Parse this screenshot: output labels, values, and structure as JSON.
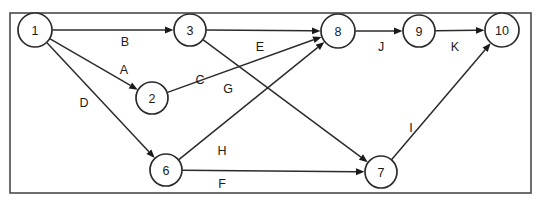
{
  "diagram": {
    "type": "directed-activity-network",
    "frame": {
      "x": 10,
      "y": 13,
      "width": 521,
      "height": 180
    },
    "nodes": [
      {
        "id": "1",
        "label": "1",
        "cx": 35,
        "cy": 30,
        "r": 17
      },
      {
        "id": "3",
        "label": "3",
        "cx": 190,
        "cy": 30,
        "r": 16
      },
      {
        "id": "2",
        "label": "2",
        "cx": 152,
        "cy": 98,
        "r": 16
      },
      {
        "id": "8",
        "label": "8",
        "cx": 338,
        "cy": 31,
        "r": 17
      },
      {
        "id": "9",
        "label": "9",
        "cx": 419,
        "cy": 31,
        "r": 16
      },
      {
        "id": "10",
        "label": "10",
        "cx": 502,
        "cy": 30,
        "r": 17
      },
      {
        "id": "6",
        "label": "6",
        "cx": 166,
        "cy": 170,
        "r": 16
      },
      {
        "id": "7",
        "label": "7",
        "cx": 381,
        "cy": 172,
        "r": 16
      }
    ],
    "edges": [
      {
        "id": "B",
        "label": "B",
        "from": "1",
        "to": "3",
        "label_x": 125,
        "label_y": 42
      },
      {
        "id": "A",
        "label": "A",
        "from": "1",
        "to": "2",
        "label_x": 124,
        "label_y": 70
      },
      {
        "id": "D",
        "label": "D",
        "from": "1",
        "to": "6",
        "label_x": 84,
        "label_y": 103
      },
      {
        "id": "E",
        "label": "E",
        "from": "3",
        "to": "8",
        "label_x": 260,
        "label_y": 47
      },
      {
        "id": "G",
        "label": "G",
        "from": "3",
        "to": "7",
        "label_x": 228,
        "label_y": 89
      },
      {
        "id": "C",
        "label": "C",
        "from": "2",
        "to": "8",
        "label_x": 200,
        "label_y": 80
      },
      {
        "id": "H",
        "label": "H",
        "from": "6",
        "to": "8",
        "label_x": 222,
        "label_y": 151
      },
      {
        "id": "F",
        "label": "F",
        "from": "6",
        "to": "7",
        "label_x": 222,
        "label_y": 184
      },
      {
        "id": "J",
        "label": "J",
        "from": "8",
        "to": "9",
        "label_x": 381,
        "label_y": 47
      },
      {
        "id": "K",
        "label": "K",
        "from": "9",
        "to": "10",
        "label_x": 455,
        "label_y": 47
      },
      {
        "id": "I",
        "label": "I",
        "from": "7",
        "to": "10",
        "label_x": 411,
        "label_y": 128
      }
    ],
    "colors": {
      "stroke": "#2b2b2b",
      "frame": "#4a4a4a",
      "background": "#ffffff",
      "text": "#1a1a1a"
    }
  }
}
